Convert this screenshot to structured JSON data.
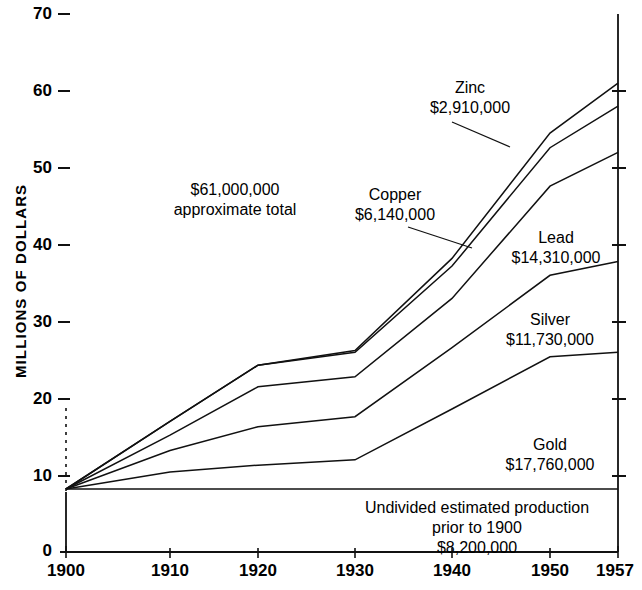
{
  "chart_data": {
    "type": "area",
    "title": "",
    "subtitle": "",
    "xlabel": "",
    "ylabel": "MILLIONS OF DOLLARS",
    "xlim": [
      1900,
      1957
    ],
    "ylim": [
      0,
      70
    ],
    "grid": false,
    "legend_position": "inline-annotations",
    "x": [
      1900,
      1910,
      1920,
      1930,
      1940,
      1950,
      1957
    ],
    "xticks": [
      "1900",
      "1910",
      "1920",
      "1930",
      "1940",
      "1950",
      "1957"
    ],
    "yticks": [
      "0",
      "10",
      "20",
      "30",
      "40",
      "50",
      "60",
      "70"
    ],
    "baseline_value": 8.2,
    "note": "Cumulative stacked production value; each line is a running cumulative total, baseline is undivided pre-1900 production of $8,200,000",
    "series": [
      {
        "name": "Gold",
        "label": "Gold",
        "amount": "$17,760,000",
        "values": [
          8.2,
          8.2,
          8.2,
          8.2,
          8.2,
          8.2,
          8.2
        ]
      },
      {
        "name": "Gold cumulative",
        "label": "Gold",
        "amount": "$17,760,000",
        "values": [
          8.2,
          10.4,
          11.3,
          12.0,
          18.6,
          25.4,
          26.0
        ]
      },
      {
        "name": "Silver cumulative",
        "label": "Silver",
        "amount": "$11,730,000",
        "values": [
          8.2,
          13.2,
          16.3,
          17.6,
          26.6,
          36.0,
          37.8
        ]
      },
      {
        "name": "Lead cumulative",
        "label": "Lead",
        "amount": "$14,310,000",
        "values": [
          8.2,
          15.2,
          21.5,
          22.8,
          33.0,
          47.6,
          52.0
        ]
      },
      {
        "name": "Copper cumulative",
        "label": "Copper",
        "amount": "$6,140,000",
        "values": [
          8.2,
          17.0,
          24.3,
          26.0,
          37.2,
          52.6,
          58.0
        ]
      },
      {
        "name": "Zinc cumulative",
        "label": "Zinc",
        "amount": "$2,910,000",
        "values": [
          8.2,
          17.0,
          24.3,
          26.2,
          38.2,
          54.5,
          61.0
        ]
      }
    ],
    "annotations": {
      "total": {
        "line1": "$61,000,000",
        "line2": "approximate total"
      },
      "zinc": {
        "line1": "Zinc",
        "line2": "$2,910,000"
      },
      "copper": {
        "line1": "Copper",
        "line2": "$6,140,000"
      },
      "lead": {
        "line1": "Lead",
        "line2": "$14,310,000"
      },
      "silver": {
        "line1": "Silver",
        "line2": "$11,730,000"
      },
      "gold": {
        "line1": "Gold",
        "line2": "$17,760,000"
      },
      "undivided": {
        "line1": "Undivided estimated production",
        "line2": "prior to 1900",
        "line3": "$8,200,000"
      }
    }
  },
  "axis": {
    "y_title": "MILLIONS OF DOLLARS",
    "y_labels": [
      "70",
      "60",
      "50",
      "40",
      "30",
      "20",
      "10",
      "0"
    ],
    "x_labels": [
      "1900",
      "1910",
      "1920",
      "1930",
      "1940",
      "1950",
      "1957"
    ]
  },
  "colors": {
    "ink": "#111111",
    "background": "#ffffff"
  }
}
